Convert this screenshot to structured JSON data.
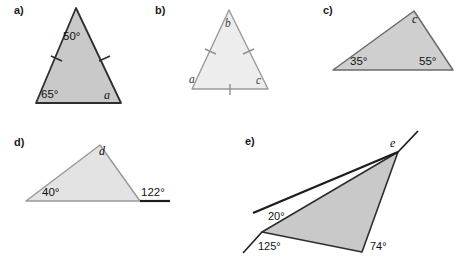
{
  "page": {
    "background_color": "#ffffff",
    "width": 460,
    "height": 259
  },
  "colors": {
    "fill_dark": "#c9c9c9",
    "fill_light": "#ededed",
    "stroke_dark": "#2e2e2e",
    "stroke_light": "#9a9a9a",
    "stroke_mid": "#6b6b6b",
    "text": "#111111"
  },
  "figures": [
    {
      "id": "a",
      "label": "a)",
      "shape": "isosceles-triangle",
      "fill": "#c9c9c9",
      "stroke": "#2e2e2e",
      "tick_marks": 2,
      "angles": [
        {
          "name": "apex-angle",
          "value": "50°"
        },
        {
          "name": "bottom-left-angle",
          "value": "65°"
        },
        {
          "name": "unknown-angle",
          "value": "a"
        }
      ]
    },
    {
      "id": "b",
      "label": "b)",
      "shape": "equilateral-triangle",
      "fill": "#ededed",
      "stroke": "#9a9a9a",
      "tick_marks": 3,
      "angles": [
        {
          "name": "apex-angle",
          "value": "b"
        },
        {
          "name": "bottom-left-angle",
          "value": "a"
        },
        {
          "name": "bottom-right-angle",
          "value": "c"
        }
      ]
    },
    {
      "id": "c",
      "label": "c)",
      "shape": "scalene-triangle",
      "fill": "#cfcfcf",
      "stroke": "#6b6b6b",
      "tick_marks": 0,
      "angles": [
        {
          "name": "apex-angle",
          "value": "c"
        },
        {
          "name": "bottom-left-angle",
          "value": "35°"
        },
        {
          "name": "bottom-right-angle",
          "value": "55°"
        }
      ]
    },
    {
      "id": "d",
      "label": "d)",
      "shape": "triangle-with-extended-base",
      "fill": "#e3e3e3",
      "stroke": "#9a9a9a",
      "tick_marks": 0,
      "angles": [
        {
          "name": "apex-angle",
          "value": "d"
        },
        {
          "name": "bottom-left-angle",
          "value": "40°"
        },
        {
          "name": "exterior-angle",
          "value": "122°"
        }
      ]
    },
    {
      "id": "e",
      "label": "e)",
      "shape": "triangle-with-extended-sides",
      "fill": "#c9c9c9",
      "stroke": "#2e2e2e",
      "tick_marks": 0,
      "angles": [
        {
          "name": "top-angle",
          "value": "e"
        },
        {
          "name": "exterior-angle-upper",
          "value": "20°"
        },
        {
          "name": "exterior-angle-lower",
          "value": "125°"
        },
        {
          "name": "bottom-right-angle",
          "value": "74°"
        }
      ]
    }
  ]
}
